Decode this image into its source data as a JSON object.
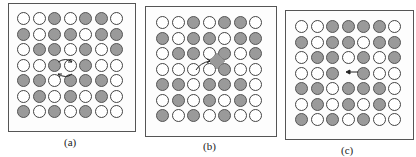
{
  "colors": {
    "gray_atom": "#9a9a9a",
    "white_atom": "#ffffff",
    "outline": "#444444"
  },
  "legend": {
    "G": "gray atom (solute)",
    "W": "white atom (host)",
    "E": "vacancy"
  },
  "panels": [
    {
      "label": "(a)",
      "mechanism": "exchange",
      "rows": [
        "WWGWGGW",
        "GWGGWGG",
        "WGGWGWG",
        "WWGWGWW",
        "GGWGGGW",
        "WGWGWGW",
        "GWGWGWW"
      ],
      "icons": [
        "exchange-arrows-icon"
      ]
    },
    {
      "label": "(b)",
      "mechanism": "interstitial",
      "rows": [
        "WWGWGGW",
        "GWGGWGG",
        "WGGWGWG",
        "WWWWGWW",
        "GGWGGGW",
        "WGWGWGW",
        "GWGWGWW"
      ],
      "icons": [
        "interstitial-atom-icon",
        "jump-arrow-icon"
      ]
    },
    {
      "label": "(c)",
      "mechanism": "vacancy",
      "rows": [
        "WWGGGGW",
        "GWGGWGG",
        "WGGWGWG",
        "WWGEGWW",
        "GGWGGGW",
        "WGWGWGW",
        "GWGWGWW"
      ],
      "icons": [
        "left-arrow-icon"
      ]
    }
  ]
}
